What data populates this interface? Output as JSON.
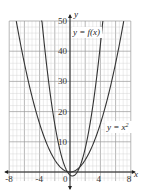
{
  "chart_data": {
    "type": "line",
    "title": "",
    "xlabel": "x",
    "ylabel": "y",
    "xlim": [
      -8,
      8
    ],
    "ylim": [
      -3,
      50
    ],
    "grid": true,
    "x_ticks": [
      -8,
      -4,
      0,
      4,
      8
    ],
    "y_ticks": [
      10,
      20,
      30,
      40,
      50
    ],
    "x_tick_labels": [
      "-8",
      "-4",
      "0",
      "4",
      "8"
    ],
    "y_tick_labels": [
      "10",
      "20",
      "30",
      "40",
      "50"
    ],
    "series": [
      {
        "name": "y = x²",
        "formula": "x^2",
        "x": [
          -7,
          -6,
          -5,
          -4,
          -3,
          -2,
          -1,
          0,
          1,
          2,
          3,
          4,
          5,
          6,
          7
        ],
        "values": [
          49,
          36,
          25,
          16,
          9,
          4,
          1,
          0,
          1,
          4,
          9,
          16,
          25,
          36,
          49
        ]
      },
      {
        "name": "y = f(x)",
        "formula": "approx 3.2x^2 - 2x - 1",
        "x": [
          -3.8,
          -3,
          -2,
          -1,
          0,
          0.3,
          1,
          2,
          3,
          4,
          4.3
        ],
        "values": [
          52.8,
          34.8,
          15.8,
          4.2,
          -1,
          -1.3,
          0.2,
          8.8,
          22.8,
          42.2,
          49.6
        ]
      }
    ],
    "annotations": [
      {
        "text": "y = f(x)",
        "x": 1.2,
        "y": 45
      },
      {
        "text": "y = x²",
        "x": 5.5,
        "y": 14
      }
    ]
  },
  "labels": {
    "x_axis": "x",
    "y_axis": "y",
    "fx": "y = f(x)",
    "x2": "y = x",
    "x2_exp": "2",
    "origin": "0"
  },
  "colors": {
    "curve": "#333333",
    "grid_minor": "#cfcfcf",
    "grid_major": "#9a9a9a",
    "axis": "#222222"
  }
}
